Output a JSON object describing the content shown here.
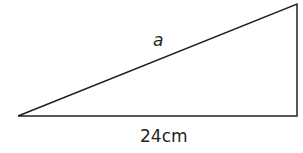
{
  "diagram": {
    "type": "right-triangle",
    "stroke_color": "#231f20",
    "labels": {
      "hypotenuse": "a",
      "base": "24cm"
    }
  }
}
